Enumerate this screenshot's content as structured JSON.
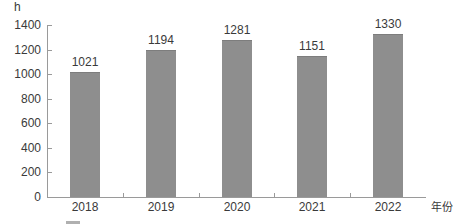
{
  "chart_data": {
    "type": "bar",
    "title": "",
    "subtitle": "",
    "xlabel": "年份",
    "ylabel": "h",
    "categories": [
      "2018",
      "2019",
      "2020",
      "2021",
      "2022"
    ],
    "values": [
      1021,
      1194,
      1281,
      1151,
      1330
    ],
    "series": [
      {
        "name": "",
        "values": [
          1021,
          1194,
          1281,
          1151,
          1330
        ]
      }
    ],
    "value_labels": [
      "1021",
      "1194",
      "1281",
      "1151",
      "1330"
    ],
    "ylim": [
      0,
      1400
    ],
    "ytick_values": [
      0,
      200,
      400,
      600,
      800,
      1000,
      1200,
      1400
    ],
    "ytick_labels": [
      "0",
      "200",
      "400",
      "600",
      "800",
      "1000",
      "1200",
      "1400"
    ],
    "grid": false,
    "legend_position": "none",
    "bar_color": "#8e8e8e",
    "axis_color": "#9a9a9a",
    "text_color": "#3a3a3a"
  },
  "axes": {
    "y_unit_label": "h",
    "x_axis_name": "年份"
  },
  "caption": {
    "text": ""
  }
}
